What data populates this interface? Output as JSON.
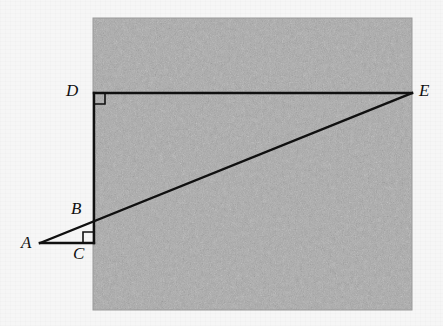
{
  "figure": {
    "background_color": "#f6f6f6",
    "texture_region": {
      "name": "gray-textured-square",
      "fill_color": "#a9a9a9",
      "x": 93,
      "y": 18,
      "width": 319,
      "height": 292
    },
    "line_color": "#101010",
    "line_width": 2.4,
    "points": [
      {
        "id": "A",
        "label": "A",
        "x": 40,
        "y": 243,
        "label_x": 21,
        "label_y": 234
      },
      {
        "id": "B",
        "label": "B",
        "x": 94,
        "y": 218,
        "label_x": 71,
        "label_y": 200
      },
      {
        "id": "C",
        "label": "C",
        "x": 94,
        "y": 243,
        "label_x": 73,
        "label_y": 245
      },
      {
        "id": "D",
        "label": "D",
        "x": 94,
        "y": 93,
        "label_x": 66,
        "label_y": 82
      },
      {
        "id": "E",
        "label": "E",
        "x": 412,
        "y": 93,
        "label_x": 419,
        "label_y": 82
      }
    ],
    "segments": [
      {
        "name": "segment-D-E",
        "from": "D",
        "to": "E"
      },
      {
        "name": "segment-D-C",
        "from": "D",
        "to": "C"
      },
      {
        "name": "segment-A-C",
        "from": "A",
        "to": "C"
      },
      {
        "name": "segment-A-E",
        "from": "A",
        "to": "E"
      }
    ],
    "right_angles": [
      {
        "name": "right-angle-marker-D",
        "vertex": "D",
        "size": 11,
        "dir_x": 1,
        "dir_y": 1
      },
      {
        "name": "right-angle-marker-C",
        "vertex": "C",
        "size": 11,
        "dir_x": -1,
        "dir_y": -1
      }
    ]
  }
}
